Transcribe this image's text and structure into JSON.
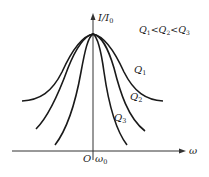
{
  "diagram": {
    "y_axis": {
      "label": "I/I",
      "label_sub": "0"
    },
    "x_axis": {
      "label": "ω"
    },
    "origin_label": "O",
    "resonance_label": {
      "main": "ω",
      "sub": "0"
    },
    "relation": {
      "parts": [
        {
          "main": "Q",
          "sub": "1"
        },
        {
          "op": "<"
        },
        {
          "main": "Q",
          "sub": "2"
        },
        {
          "op": "<"
        },
        {
          "main": "Q",
          "sub": "3"
        }
      ]
    },
    "curves": [
      {
        "name": "Q",
        "sub": "1",
        "description": "widest curve, lowest Q"
      },
      {
        "name": "Q",
        "sub": "2",
        "description": "middle curve"
      },
      {
        "name": "Q",
        "sub": "3",
        "description": "narrowest curve, highest Q"
      }
    ]
  }
}
